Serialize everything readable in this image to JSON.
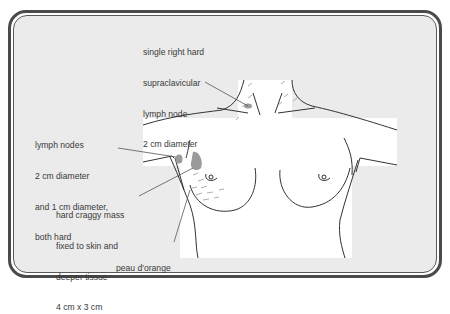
{
  "figure": {
    "colors": {
      "background": "#ebebeb",
      "body": "#ffffff",
      "outline": "#3a3a3a",
      "mass_fill": "#9a9a9a",
      "border": "#4a4a4a"
    },
    "labels": {
      "supraclavicular": [
        "single right hard",
        "supraclavicular",
        "lymph node",
        "2 cm diameter"
      ],
      "axillary": [
        "lymph nodes",
        "2 cm diameter",
        "and 1 cm diameter,",
        "both hard"
      ],
      "mass": [
        "hard craggy mass",
        "fixed to skin and",
        "deeper tissue",
        "4 cm x 3 cm"
      ],
      "skin": [
        "peau d'orange"
      ]
    }
  }
}
